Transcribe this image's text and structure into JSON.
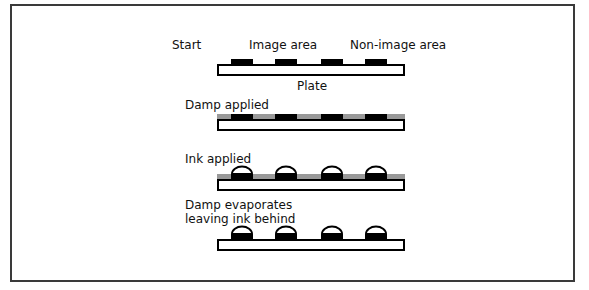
{
  "labels": {
    "start": "Start",
    "image_area": "Image area",
    "non_image_area": "Non-image area",
    "plate": "Plate",
    "damp_applied": "Damp applied",
    "ink_applied": "Ink applied",
    "damp_evaporates_1": "Damp evaporates",
    "damp_evaporates_2": "leaving ink behind"
  },
  "colors": {
    "border": "#3a3a3a",
    "ink": "#000000",
    "damp": "#999999",
    "plate": "#ffffff"
  },
  "stages": [
    {
      "name": "start",
      "plate_top": 64,
      "has_damp": false,
      "has_ink": false
    },
    {
      "name": "damp-applied",
      "plate_top": 119,
      "has_damp": true,
      "has_ink": false
    },
    {
      "name": "ink-applied",
      "plate_top": 179,
      "has_damp": true,
      "has_ink": true
    },
    {
      "name": "damp-evaporated",
      "plate_top": 239,
      "has_damp": false,
      "has_ink": true
    }
  ]
}
